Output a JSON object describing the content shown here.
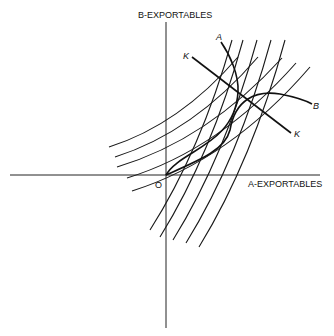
{
  "diagram": {
    "axes": {
      "x_label": "A-EXPORTABLES",
      "y_label": "B-EXPORTABLES",
      "origin_label": "O"
    },
    "curve_labels": {
      "a": "A",
      "b": "B",
      "k_start": "K",
      "k_end": "K"
    },
    "families": {
      "steep_count": 5,
      "flat_count": 5
    }
  }
}
